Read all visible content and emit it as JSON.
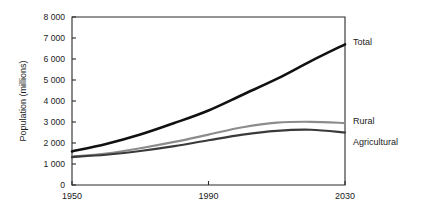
{
  "chart_data": {
    "type": "line",
    "title": "",
    "xlabel": "",
    "ylabel": "Population (millions)",
    "xlim": [
      1950,
      2030
    ],
    "ylim": [
      0,
      8000
    ],
    "grid": false,
    "legend_position": "right-of-plot-inline",
    "xticks": [
      "1950",
      "1990",
      "2030"
    ],
    "xtick_values": [
      1950,
      1990,
      2030
    ],
    "yticks": [
      "0",
      "1 000",
      "2 000",
      "3 000",
      "4 000",
      "5 000",
      "6 000",
      "7 000",
      "8 000"
    ],
    "ytick_values": [
      0,
      1000,
      2000,
      3000,
      4000,
      5000,
      6000,
      7000,
      8000
    ],
    "x": [
      1950,
      1960,
      1970,
      1980,
      1990,
      2000,
      2010,
      2020,
      2030
    ],
    "series": [
      {
        "name": "Total",
        "color": "#111111",
        "values": [
          1600,
          1950,
          2400,
          2950,
          3550,
          4300,
          5050,
          5900,
          6700
        ]
      },
      {
        "name": "Rural",
        "color": "#8c8c8c",
        "values": [
          1350,
          1500,
          1750,
          2050,
          2400,
          2750,
          2970,
          3010,
          2950
        ]
      },
      {
        "name": "Agricultural",
        "color": "#3a3a3a",
        "values": [
          1330,
          1440,
          1620,
          1850,
          2130,
          2400,
          2580,
          2630,
          2500
        ]
      }
    ]
  },
  "axis": {
    "y_title": "Population (millions)"
  },
  "labels": {
    "total": "Total",
    "rural": "Rural",
    "agricultural": "Agricultural"
  }
}
